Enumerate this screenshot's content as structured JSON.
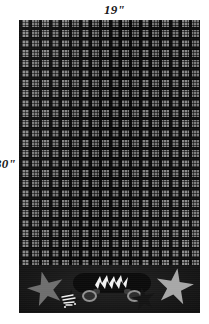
{
  "diagram": {
    "dimensions": {
      "width_label": "19\"",
      "height_label": "30\""
    },
    "panel": {
      "fabric": {
        "pattern_name": "plaid",
        "dark_color": "#0d0d0d",
        "light_color": "#8c8c8c",
        "mid_color": "#7d7d7d"
      },
      "border_band": {
        "background_color": "#191919",
        "motifs": [
          {
            "name": "star-left-large",
            "color": "#6e6e6e"
          },
          {
            "name": "star-left-small",
            "color": "#121212"
          },
          {
            "name": "skateboard",
            "deck_color": "#0b0b0b",
            "bolt_color": "#f2f2f2",
            "wheel_color": "#909090"
          },
          {
            "name": "star-right-small",
            "color": "#131313"
          },
          {
            "name": "star-right-large",
            "color": "#a7a7a7"
          }
        ]
      }
    }
  }
}
